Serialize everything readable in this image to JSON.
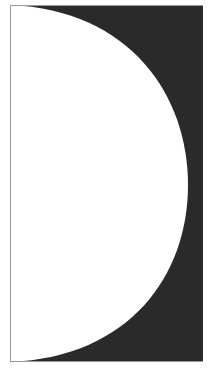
{
  "figure": {
    "shape": "half-disc",
    "colors": {
      "background": "#ffffff",
      "dark_fill": "#2a2a2a",
      "shape_fill": "#ffffff",
      "border": "#9a9a9a"
    }
  }
}
